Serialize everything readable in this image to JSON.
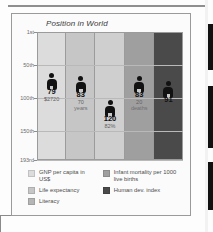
{
  "figure": {
    "title": "Position in World"
  },
  "chart_data": {
    "type": "scatter",
    "title": "Position in World",
    "xlabel": "",
    "ylabel": "",
    "ylim": [
      1,
      193
    ],
    "y_axis_inverted": true,
    "grid": true,
    "ytick_labels": [
      "1st",
      "50th",
      "100th",
      "150th",
      "193rd"
    ],
    "ytick_values": [
      1,
      50,
      100,
      150,
      193
    ],
    "legend_position": "bottom",
    "categories": [
      "GNP per capita in US$",
      "Life expectancy",
      "Literacy",
      "Infant mortality per 1000 live births",
      "Human dev. index"
    ],
    "values": [
      79,
      83,
      120,
      83,
      91
    ],
    "point_labels": [
      "79",
      "83",
      "120",
      "83",
      "91"
    ],
    "point_sublabels": [
      "$2720",
      "70\nyears",
      "82%",
      "20\ndeaths",
      ""
    ],
    "points": [
      {
        "rank": 79,
        "rank_label": "79",
        "value_line1": "$2720",
        "value_line2": "",
        "category": "GNP per capita in US$"
      },
      {
        "rank": 83,
        "rank_label": "83",
        "value_line1": "70",
        "value_line2": "years",
        "category": "Life expectancy"
      },
      {
        "rank": 120,
        "rank_label": "120",
        "value_line1": "82%",
        "value_line2": "",
        "category": "Literacy"
      },
      {
        "rank": 83,
        "rank_label": "83",
        "value_line1": "20",
        "value_line2": "deaths",
        "category": "Infant mortality per 1000 live births"
      },
      {
        "rank": 91,
        "rank_label": "91",
        "value_line1": "",
        "value_line2": "",
        "category": "Human dev. index"
      }
    ],
    "band_colors": [
      "#dcdcdc",
      "#c6c6c6",
      "#cfcfcf",
      "#9f9f9f",
      "#4a4a4a"
    ]
  },
  "axis": {
    "t1": "1st",
    "t2": "50th",
    "t3": "100th",
    "t4": "150th",
    "t5": "193rd"
  },
  "points": {
    "p1": {
      "value": "79",
      "sub1": "$2720",
      "sub2": ""
    },
    "p2": {
      "value": "83",
      "sub1": "70",
      "sub2": "years"
    },
    "p3": {
      "value": "120",
      "sub1": "82%",
      "sub2": ""
    },
    "p4": {
      "value": "83",
      "sub1": "20",
      "sub2": "deaths"
    },
    "p5": {
      "value": "91",
      "sub1": "",
      "sub2": ""
    }
  },
  "legend": {
    "left": [
      {
        "label": "GNP per capita in US$",
        "color": "#dcdcdc"
      },
      {
        "label": "Life expectancy",
        "color": "#c6c6c6"
      },
      {
        "label": "Literacy",
        "color": "#b5b5b5"
      }
    ],
    "right": [
      {
        "label": "Infant mortality per",
        "label2": "1000 live births",
        "color": "#9f9f9f"
      },
      {
        "label": "Human dev. index",
        "label2": "",
        "color": "#4a4a4a"
      }
    ]
  }
}
